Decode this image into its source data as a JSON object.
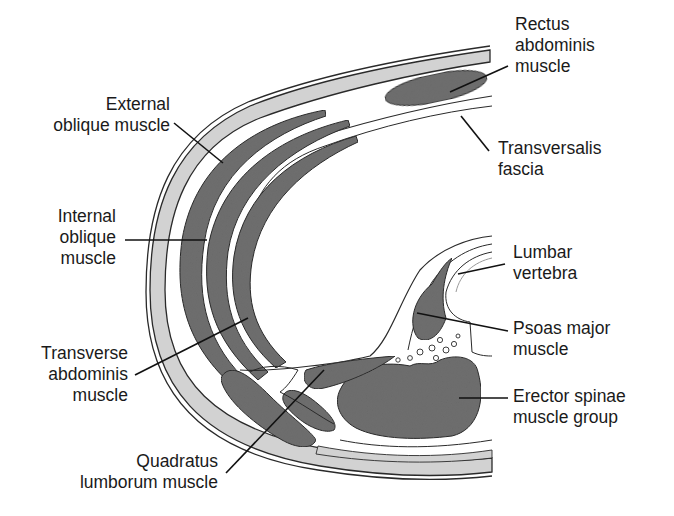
{
  "diagram": {
    "colors": {
      "muscle": "#6f6f6f",
      "fascia": "#d2d2d2",
      "outline": "#2a2a2a",
      "background": "#ffffff",
      "text": "#1a1a1a"
    },
    "labels": {
      "rectus_abdominis": "Rectus\nabdominis\nmuscle",
      "transversalis_fascia": "Transversalis\nfascia",
      "external_oblique": "External\noblique muscle",
      "internal_oblique": "Internal\noblique\nmuscle",
      "lumbar_vertebra": "Lumbar\nvertebra",
      "psoas_major": "Psoas major\nmuscle",
      "transverse_abdominis": "Transverse\nabdominis\nmuscle",
      "erector_spinae": "Erector spinae\nmuscle group",
      "quadratus_lumborum": "Quadratus\nlumborum muscle"
    }
  }
}
